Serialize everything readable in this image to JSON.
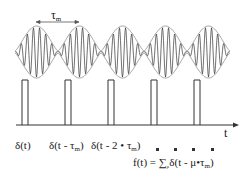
{
  "diagram": {
    "period_label": {
      "symbol": "τ",
      "sub": "m"
    },
    "axis_label": "t",
    "pulse_count": 5,
    "wave_packets": 5,
    "colors": {
      "line": "#333333",
      "envelope": "#888888",
      "background": "#ffffff"
    },
    "pulse_labels": [
      {
        "pre": "δ(t)",
        "sym": "",
        "sub": "",
        "post": ""
      },
      {
        "pre": "δ(t - ",
        "sym": "τ",
        "sub": "m",
        "post": ")"
      },
      {
        "pre": "δ(t - 2 • ",
        "sym": "τ",
        "sub": "m",
        "post": ")"
      }
    ],
    "continuation": "- - - -",
    "formula": {
      "pre": "f(t) = ∑",
      "index": "μ",
      "mid": "δ(t - μ•",
      "sym": "τ",
      "sub": "m",
      "post": ")"
    }
  }
}
